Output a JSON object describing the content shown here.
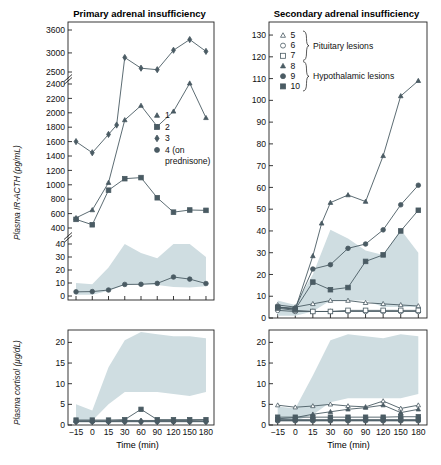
{
  "figure": {
    "xlabel": "Time (min)",
    "ylabel_acth": "Plasma IR-ACTH (pg/mL)",
    "ylabel_cortisol": "Plasma cortisol (µg/dL)",
    "band_color": "#cfdde1",
    "series_color": "#4a5b63",
    "axis_color": "#222222"
  },
  "panels": {
    "left": {
      "title": "Primary adrenal insufficiency",
      "legend": [
        {
          "label": "1",
          "marker": "triangle",
          "filled": true
        },
        {
          "label": "2",
          "marker": "square",
          "filled": true
        },
        {
          "label": "3",
          "marker": "diamond",
          "filled": true
        },
        {
          "label": "4 (on",
          "marker": "circle",
          "filled": true
        },
        {
          "label": "prednisone)",
          "marker": "none",
          "filled": false
        }
      ]
    },
    "right": {
      "title": "Secondary adrenal insufficiency",
      "legend": [
        {
          "label": "5",
          "marker": "triangle",
          "filled": false
        },
        {
          "label": "6",
          "marker": "circle",
          "filled": false
        },
        {
          "label": "7",
          "marker": "square",
          "filled": false
        },
        {
          "label": "8",
          "marker": "triangle",
          "filled": true
        },
        {
          "label": "9",
          "marker": "circle",
          "filled": true
        },
        {
          "label": "10",
          "marker": "square",
          "filled": true
        }
      ],
      "legend_groups": [
        {
          "label": "Pituitary lesions"
        },
        {
          "label": "Hypothalamic lesions"
        }
      ]
    }
  },
  "chart_data": [
    {
      "type": "line",
      "id": "primary-acth",
      "title": "Primary adrenal insufficiency",
      "xlabel": "Time (min)",
      "ylabel": "Plasma IR-ACTH (pg/mL)",
      "x": [
        -15,
        0,
        15,
        30,
        60,
        90,
        120,
        150,
        180
      ],
      "xticks": [
        "−15",
        "0",
        "15",
        "30",
        "60",
        "90",
        "120",
        "150",
        "180"
      ],
      "yticks_upper": [
        400,
        600,
        800,
        1000,
        1200,
        1400,
        1600,
        1800,
        2000,
        2200,
        2400,
        2500,
        3000,
        3600
      ],
      "yticks_lower": [
        0,
        10,
        20,
        30,
        40
      ],
      "axis_breaks": [
        [
          2400,
          2500
        ],
        [
          400,
          40
        ]
      ],
      "grid": false,
      "series": [
        {
          "name": "1",
          "marker": "triangle",
          "filled": true,
          "values": [
            540,
            650,
            1030,
            1900,
            2100,
            1810,
            2020,
            2410,
            1930
          ]
        },
        {
          "name": "2",
          "marker": "square",
          "filled": true,
          "values": [
            520,
            445,
            925,
            1085,
            1100,
            820,
            620,
            650,
            645
          ]
        },
        {
          "name": "3",
          "marker": "diamond",
          "filled": true,
          "values": [
            1600,
            1445,
            1700,
            1830,
            2880,
            2600,
            2560,
            3070,
            3350,
            3040
          ]
        },
        {
          "name": "4 (on prednisone)",
          "marker": "circle",
          "filled": true,
          "values": [
            3.2,
            3.4,
            4.6,
            8.9,
            9.0,
            9.7,
            14.6,
            13.0,
            9.6
          ],
          "scale": "lower"
        }
      ]
    },
    {
      "type": "line",
      "id": "primary-cortisol",
      "xlabel": "Time (min)",
      "ylabel": "Plasma cortisol (µg/dL)",
      "x": [
        -15,
        0,
        15,
        30,
        60,
        90,
        120,
        150,
        180
      ],
      "yticks": [
        0,
        5,
        10,
        15,
        20
      ],
      "ylim": [
        0,
        23
      ],
      "grid": false,
      "series": [
        {
          "name": "1",
          "marker": "triangle",
          "filled": true,
          "values": [
            1.0,
            1.0,
            1.0,
            1.1,
            1.1,
            1.1,
            1.1,
            1.1,
            1.2
          ]
        },
        {
          "name": "2",
          "marker": "square",
          "filled": true,
          "values": [
            1.2,
            1.2,
            1.2,
            1.3,
            3.8,
            1.3,
            1.3,
            1.3,
            1.3
          ]
        },
        {
          "name": "3",
          "marker": "diamond",
          "filled": true,
          "values": [
            0.9,
            0.9,
            0.9,
            0.9,
            0.9,
            0.9,
            0.9,
            0.9,
            0.9
          ]
        },
        {
          "name": "4 (on prednisone)",
          "marker": "circle",
          "filled": true,
          "values": [
            0.8,
            0.8,
            0.8,
            0.8,
            0.8,
            0.8,
            0.8,
            0.8,
            0.8
          ]
        }
      ],
      "normal_range_band": {
        "label": "normal range",
        "x": [
          -15,
          0,
          15,
          30,
          60,
          90,
          120,
          150,
          180
        ],
        "low": [
          1.0,
          1.0,
          5.0,
          8.0,
          8.0,
          8.0,
          7.5,
          7.0,
          8.0
        ],
        "high": [
          5.0,
          3.5,
          14.0,
          20.5,
          22.5,
          22.0,
          21.5,
          21.5,
          21.0
        ]
      }
    },
    {
      "type": "line",
      "id": "secondary-acth",
      "title": "Secondary adrenal insufficiency",
      "xlabel": "Time (min)",
      "ylabel": "Plasma IR-ACTH (pg/mL)",
      "x": [
        -15,
        0,
        15,
        30,
        60,
        90,
        120,
        150,
        180
      ],
      "yticks": [
        0,
        10,
        20,
        30,
        40,
        50,
        60,
        70,
        80,
        90,
        100,
        110,
        120,
        130
      ],
      "ylim": [
        0,
        136
      ],
      "grid": false,
      "series": [
        {
          "name": "5",
          "marker": "triangle",
          "filled": false,
          "values": [
            6.0,
            5.0,
            6.5,
            8.0,
            8.0,
            7.0,
            6.5,
            6.0,
            5.5
          ]
        },
        {
          "name": "6",
          "marker": "circle",
          "filled": false,
          "values": [
            3.5,
            3.0,
            3.0,
            3.0,
            3.0,
            3.0,
            3.0,
            3.0,
            3.0
          ]
        },
        {
          "name": "7",
          "marker": "square",
          "filled": false,
          "values": [
            4.5,
            3.5,
            3.0,
            3.0,
            3.5,
            3.5,
            3.5,
            3.5,
            3.5
          ]
        },
        {
          "name": "8",
          "marker": "triangle",
          "filled": true,
          "values": [
            5.0,
            4.0,
            28.5,
            43.5,
            53.0,
            56.5,
            53.5,
            74.5,
            102.0,
            109.0
          ]
        },
        {
          "name": "9",
          "marker": "circle",
          "filled": true,
          "values": [
            5.0,
            4.5,
            22.5,
            24.5,
            32.0,
            34.0,
            40.5,
            52.0,
            61.0
          ]
        },
        {
          "name": "10",
          "marker": "square",
          "filled": true,
          "values": [
            5.0,
            4.0,
            16.5,
            13.0,
            14.0,
            26.0,
            29.0,
            40.0,
            49.5
          ]
        }
      ],
      "normal_range_band": {
        "label": "normal range",
        "x": [
          -15,
          0,
          15,
          30,
          60,
          90,
          120,
          150,
          180
        ],
        "low": [
          1.0,
          1.0,
          3.0,
          8.0,
          8.0,
          8.0,
          5.0,
          5.0,
          5.0
        ],
        "high": [
          8.0,
          6.0,
          20.0,
          40.5,
          36.5,
          31.0,
          29.0,
          40.5,
          30.0
        ]
      }
    },
    {
      "type": "line",
      "id": "secondary-cortisol",
      "xlabel": "Time (min)",
      "ylabel": "Plasma cortisol (µg/dL)",
      "x": [
        -15,
        0,
        15,
        30,
        60,
        90,
        120,
        150,
        180
      ],
      "yticks": [
        0,
        5,
        10,
        15,
        20
      ],
      "ylim": [
        0,
        23
      ],
      "grid": false,
      "series": [
        {
          "name": "5",
          "marker": "triangle",
          "filled": false,
          "values": [
            4.8,
            4.3,
            4.6,
            5.0,
            4.6,
            4.4,
            5.8,
            4.0,
            4.8
          ]
        },
        {
          "name": "6",
          "marker": "circle",
          "filled": false,
          "values": [
            1.0,
            1.0,
            1.0,
            1.0,
            1.0,
            1.0,
            1.0,
            1.0,
            1.0
          ]
        },
        {
          "name": "7",
          "marker": "square",
          "filled": false,
          "values": [
            1.3,
            1.3,
            1.3,
            1.3,
            1.3,
            1.3,
            1.3,
            1.3,
            1.3
          ]
        },
        {
          "name": "8",
          "marker": "triangle",
          "filled": true,
          "values": [
            1.5,
            1.8,
            2.6,
            3.2,
            3.8,
            4.2,
            4.8,
            3.0,
            3.8
          ]
        },
        {
          "name": "9",
          "marker": "circle",
          "filled": true,
          "values": [
            1.1,
            1.1,
            1.1,
            1.1,
            1.1,
            1.1,
            1.1,
            1.1,
            1.1
          ]
        },
        {
          "name": "10",
          "marker": "square",
          "filled": true,
          "values": [
            1.9,
            1.9,
            1.9,
            1.9,
            1.9,
            1.9,
            1.9,
            2.0,
            2.0
          ]
        }
      ],
      "normal_range_band": {
        "label": "normal range",
        "x": [
          -15,
          0,
          15,
          30,
          60,
          90,
          120,
          150,
          180
        ],
        "low": [
          1.0,
          1.0,
          2.5,
          5.5,
          6.5,
          6.5,
          6.5,
          6.5,
          7.5
        ],
        "high": [
          4.5,
          4.0,
          12.0,
          20.5,
          22.0,
          21.5,
          21.0,
          22.0,
          21.5
        ]
      }
    }
  ]
}
